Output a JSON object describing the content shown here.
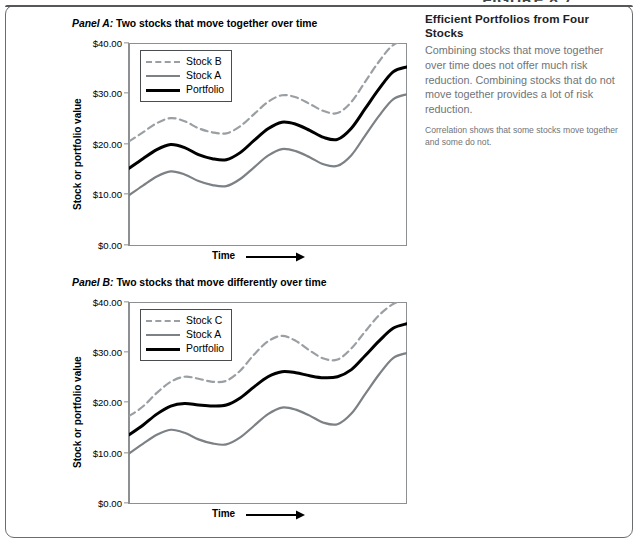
{
  "figure": {
    "title": "FIGURE 8.7"
  },
  "sidebar": {
    "heading": "Efficient Portfolios from Four Stocks",
    "body": "Combining stocks that move together over time does not offer much risk reduction. Combining stocks that do not move together provides a lot of risk reduction.",
    "note": "Correlation shows that some stocks move together and some do not."
  },
  "panels": [
    {
      "label": "Panel A:",
      "caption": "Two stocks that move together over time",
      "legend": [
        {
          "name": "Stock B",
          "style": "dashed-gray",
          "color": "#9a9fa3"
        },
        {
          "name": "Stock A",
          "style": "solid-gray",
          "color": "#7c8185"
        },
        {
          "name": "Portfolio",
          "style": "solid-black",
          "color": "#000000"
        }
      ]
    },
    {
      "label": "Panel B:",
      "caption": "Two stocks that move differently over time",
      "legend": [
        {
          "name": "Stock C",
          "style": "dashed-gray",
          "color": "#9a9fa3"
        },
        {
          "name": "Stock A",
          "style": "solid-gray",
          "color": "#7c8185"
        },
        {
          "name": "Portfolio",
          "style": "solid-black",
          "color": "#000000"
        }
      ]
    }
  ],
  "axes": {
    "y_label": "Stock or portfolio value",
    "x_label": "Time",
    "y_ticks": [
      "$40.00",
      "$30.00",
      "$20.00",
      "$10.00",
      "$0.00"
    ],
    "y_values": [
      40,
      30,
      20,
      10,
      0
    ]
  },
  "chart_data": [
    {
      "type": "line",
      "title": "Panel A: Two stocks that move together over time",
      "xlabel": "Time",
      "ylabel": "Stock or portfolio value",
      "ylim": [
        0,
        40
      ],
      "xlim": [
        0,
        100
      ],
      "yticks": [
        0,
        10,
        20,
        30,
        40
      ],
      "ytick_labels": [
        "$0.00",
        "$10.00",
        "$20.00",
        "$30.00",
        "$40.00"
      ],
      "grid": false,
      "legend_position": "top-left",
      "x": [
        0,
        5,
        10,
        15,
        20,
        25,
        30,
        35,
        40,
        45,
        50,
        55,
        60,
        65,
        70,
        75,
        80,
        85,
        90,
        95,
        100
      ],
      "series": [
        {
          "name": "Stock B",
          "style": "dashed",
          "color": "#9a9fa3",
          "values": [
            20.6,
            22.4,
            24.2,
            25.2,
            24.6,
            23.2,
            22.4,
            22.2,
            23.6,
            26.0,
            28.4,
            29.7,
            29.3,
            28.0,
            26.6,
            26.2,
            28.4,
            32.4,
            36.4,
            39.6,
            40.6
          ]
        },
        {
          "name": "Stock A",
          "style": "solid",
          "color": "#7c8185",
          "values": [
            10.0,
            11.9,
            13.7,
            14.7,
            14.1,
            12.8,
            12.0,
            11.8,
            13.2,
            15.5,
            17.8,
            19.1,
            18.7,
            17.5,
            16.1,
            15.8,
            17.9,
            21.8,
            25.7,
            28.9,
            29.9
          ]
        },
        {
          "name": "Portfolio",
          "style": "solid",
          "color": "#000000",
          "values": [
            15.3,
            17.2,
            19.0,
            20.0,
            19.4,
            18.0,
            17.2,
            17.0,
            18.4,
            20.8,
            23.1,
            24.4,
            24.0,
            22.8,
            21.4,
            21.0,
            23.2,
            27.1,
            31.0,
            34.3,
            35.3
          ]
        }
      ]
    },
    {
      "type": "line",
      "title": "Panel B: Two stocks that move differently over time",
      "xlabel": "Time",
      "ylabel": "Stock or portfolio value",
      "ylim": [
        0,
        40
      ],
      "xlim": [
        0,
        100
      ],
      "yticks": [
        0,
        10,
        20,
        30,
        40
      ],
      "ytick_labels": [
        "$0.00",
        "$10.00",
        "$20.00",
        "$30.00",
        "$40.00"
      ],
      "grid": false,
      "legend_position": "top-left",
      "x": [
        0,
        5,
        10,
        15,
        20,
        25,
        30,
        35,
        40,
        45,
        50,
        55,
        60,
        65,
        70,
        75,
        80,
        85,
        90,
        95,
        100
      ],
      "series": [
        {
          "name": "Stock C",
          "style": "dashed",
          "color": "#9a9fa3",
          "values": [
            17.4,
            19.3,
            22.0,
            24.2,
            25.2,
            24.8,
            24.2,
            24.4,
            26.4,
            29.6,
            32.2,
            33.3,
            32.3,
            30.4,
            28.8,
            28.6,
            30.8,
            34.2,
            37.4,
            39.6,
            40.5
          ]
        },
        {
          "name": "Stock A",
          "style": "solid",
          "color": "#7c8185",
          "values": [
            10.0,
            11.9,
            13.7,
            14.7,
            14.1,
            12.8,
            12.0,
            11.8,
            13.2,
            15.5,
            17.8,
            19.1,
            18.7,
            17.5,
            16.1,
            15.8,
            17.9,
            21.8,
            25.7,
            28.9,
            29.9
          ]
        },
        {
          "name": "Portfolio",
          "style": "solid",
          "color": "#000000",
          "values": [
            13.7,
            15.6,
            17.8,
            19.4,
            19.9,
            19.6,
            19.4,
            19.6,
            21.0,
            23.2,
            25.2,
            26.2,
            26.0,
            25.4,
            25.0,
            25.2,
            26.6,
            29.4,
            32.3,
            34.8,
            35.7
          ]
        }
      ]
    }
  ]
}
